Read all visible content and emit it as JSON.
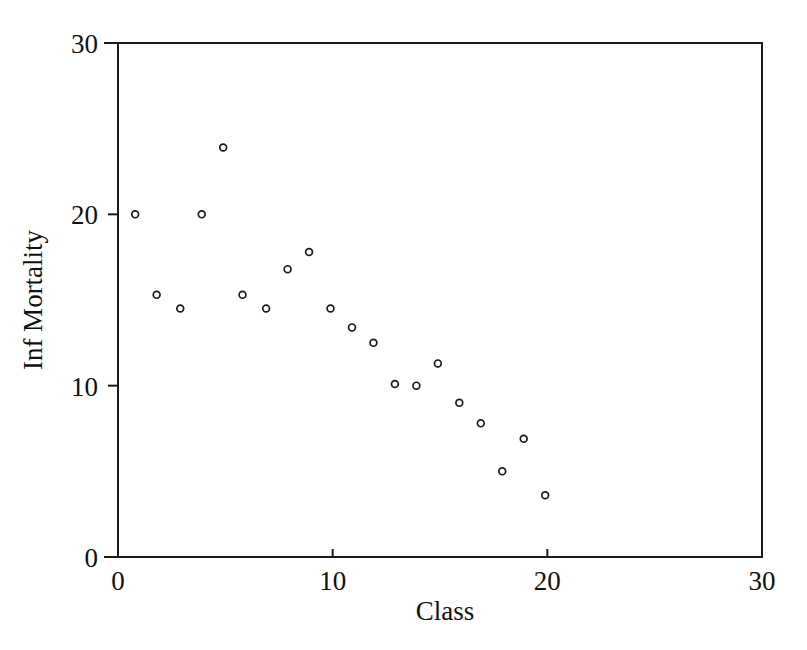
{
  "chart_data": {
    "type": "scatter",
    "title": "",
    "xlabel": "Class",
    "ylabel": "Inf Mortality",
    "xlim": [
      0,
      30
    ],
    "ylim": [
      0,
      30
    ],
    "xticks": [
      0,
      10,
      20,
      30
    ],
    "yticks": [
      0,
      10,
      20,
      30
    ],
    "xtick_labels": [
      "0",
      "10",
      "20",
      "30"
    ],
    "ytick_labels": [
      "0",
      "10",
      "20",
      "30"
    ],
    "grid": false,
    "legend": null,
    "marker": "open-circle",
    "marker_color": "#1b1b20",
    "x": [
      0.8,
      1.8,
      2.9,
      3.9,
      4.9,
      5.8,
      6.9,
      7.9,
      8.9,
      9.9,
      10.9,
      11.9,
      12.9,
      13.9,
      14.9,
      15.9,
      16.9,
      17.9,
      18.9,
      19.9
    ],
    "y": [
      20.0,
      15.3,
      14.5,
      20.0,
      23.9,
      15.3,
      14.5,
      16.8,
      17.8,
      14.5,
      13.4,
      12.5,
      10.1,
      10.0,
      11.3,
      9.0,
      7.8,
      5.0,
      6.9,
      3.6
    ],
    "points": [
      {
        "class": 0.8,
        "inf_mortality": 20.0
      },
      {
        "class": 1.8,
        "inf_mortality": 15.3
      },
      {
        "class": 2.9,
        "inf_mortality": 14.5
      },
      {
        "class": 3.9,
        "inf_mortality": 20.0
      },
      {
        "class": 4.9,
        "inf_mortality": 23.9
      },
      {
        "class": 5.8,
        "inf_mortality": 15.3
      },
      {
        "class": 6.9,
        "inf_mortality": 14.5
      },
      {
        "class": 7.9,
        "inf_mortality": 16.8
      },
      {
        "class": 8.9,
        "inf_mortality": 17.8
      },
      {
        "class": 9.9,
        "inf_mortality": 14.5
      },
      {
        "class": 10.9,
        "inf_mortality": 13.4
      },
      {
        "class": 11.9,
        "inf_mortality": 12.5
      },
      {
        "class": 12.9,
        "inf_mortality": 10.1
      },
      {
        "class": 13.9,
        "inf_mortality": 10.0
      },
      {
        "class": 14.9,
        "inf_mortality": 11.3
      },
      {
        "class": 15.9,
        "inf_mortality": 9.0
      },
      {
        "class": 16.9,
        "inf_mortality": 7.8
      },
      {
        "class": 17.9,
        "inf_mortality": 5.0
      },
      {
        "class": 18.9,
        "inf_mortality": 6.9
      },
      {
        "class": 19.9,
        "inf_mortality": 3.6
      }
    ]
  },
  "axes": {
    "x_axis_title": "Class",
    "y_axis_title": "Inf Mortality"
  },
  "colors": {
    "frame": "#1a1a1a",
    "marker": "#1b1b20",
    "background": "#ffffff"
  }
}
